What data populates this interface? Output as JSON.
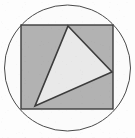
{
  "figure": {
    "title": "Circle with inscribed square and triangle",
    "canvas": {
      "width": 135,
      "height": 138,
      "background_color": "#fdfdfd"
    },
    "shapes": {
      "circle": {
        "label": "circle",
        "center_x": 67.5,
        "center_y": 68,
        "radius": 63,
        "fill_color": "#fbfbfb",
        "stroke_color": "#4a4a4a",
        "stroke_width": 1
      },
      "square": {
        "label": "square",
        "x": 21,
        "y": 25,
        "width": 92,
        "height": 84,
        "fill_color": "#b2b2b2",
        "stroke_color": "#3c3c3c",
        "stroke_width": 1.4
      },
      "triangle": {
        "label": "triangle",
        "points": "68,26 112,72 35,106",
        "vertex_top": "68,26",
        "vertex_right": "112,72",
        "vertex_bottom_left": "35,106",
        "fill_color": "#e9e9e9",
        "stroke_color": "#3c3c3c",
        "stroke_width": 1.6
      }
    }
  }
}
